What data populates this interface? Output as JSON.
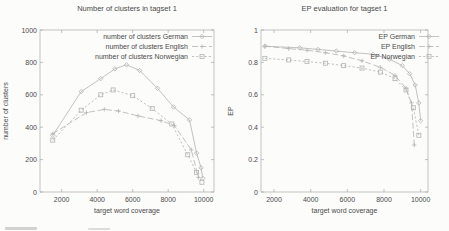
{
  "colors": {
    "line_gray": "#b2b2b2",
    "border_gray": "#a9a9a9",
    "text_gray": "#4a4a4a",
    "background": "#fcfcfb"
  },
  "chart_data": [
    {
      "type": "line",
      "title": "Number of clusters in tagset 1",
      "xlabel": "target word coverage",
      "ylabel": "number of clusters",
      "xlim": [
        780,
        10580
      ],
      "ylim": [
        0,
        1000
      ],
      "xticks": [
        2000,
        4000,
        6000,
        8000,
        10000
      ],
      "yticks": [
        0,
        200,
        400,
        600,
        800,
        1000
      ],
      "grid": false,
      "legend_position": "top-right-inside",
      "series": [
        {
          "name": "number of clusters German",
          "marker": "diamond",
          "dash": "solid",
          "points": [
            [
              1500,
              350
            ],
            [
              3100,
              620
            ],
            [
              4200,
              700
            ],
            [
              5000,
              760
            ],
            [
              5650,
              785
            ],
            [
              6400,
              750
            ],
            [
              7400,
              640
            ],
            [
              8300,
              525
            ],
            [
              9200,
              445
            ],
            [
              9600,
              240
            ],
            [
              9850,
              150
            ],
            [
              9950,
              85
            ]
          ]
        },
        {
          "name": "number of clusters English",
          "marker": "plus",
          "dash": "long-dash",
          "points": [
            [
              1500,
              360
            ],
            [
              3400,
              490
            ],
            [
              4400,
              510
            ],
            [
              5200,
              500
            ],
            [
              6300,
              470
            ],
            [
              7600,
              440
            ],
            [
              8350,
              410
            ],
            [
              9300,
              260
            ],
            [
              9700,
              90
            ]
          ]
        },
        {
          "name": "number of clusters Norwegian",
          "marker": "square",
          "dash": "short-dash",
          "points": [
            [
              1500,
              320
            ],
            [
              3100,
              505
            ],
            [
              4200,
              600
            ],
            [
              4900,
              630
            ],
            [
              6000,
              595
            ],
            [
              7100,
              515
            ],
            [
              8200,
              420
            ],
            [
              9100,
              230
            ],
            [
              9600,
              120
            ],
            [
              9900,
              60
            ]
          ]
        }
      ]
    },
    {
      "type": "line",
      "title": "EP evaluation for tagset 1",
      "xlabel": "target word coverage",
      "ylabel": "EP",
      "xlim": [
        1290,
        10400
      ],
      "ylim": [
        0,
        1
      ],
      "xticks": [
        2000,
        4000,
        6000,
        8000,
        10000
      ],
      "yticks": [
        0,
        0.2,
        0.4,
        0.6,
        0.8,
        1
      ],
      "grid": false,
      "legend_position": "top-right-inside",
      "series": [
        {
          "name": "EP German",
          "marker": "diamond",
          "dash": "solid",
          "points": [
            [
              1500,
              0.9
            ],
            [
              3400,
              0.89
            ],
            [
              4400,
              0.88
            ],
            [
              5400,
              0.87
            ],
            [
              6400,
              0.86
            ],
            [
              7400,
              0.85
            ],
            [
              8300,
              0.82
            ],
            [
              9000,
              0.78
            ],
            [
              9400,
              0.73
            ],
            [
              9700,
              0.66
            ],
            [
              9900,
              0.55
            ],
            [
              10000,
              0.44
            ]
          ]
        },
        {
          "name": "EP English",
          "marker": "plus",
          "dash": "long-dash",
          "points": [
            [
              1500,
              0.9
            ],
            [
              2800,
              0.885
            ],
            [
              3800,
              0.875
            ],
            [
              4800,
              0.86
            ],
            [
              5800,
              0.84
            ],
            [
              6800,
              0.81
            ],
            [
              7800,
              0.77
            ],
            [
              8600,
              0.72
            ],
            [
              9200,
              0.64
            ],
            [
              9500,
              0.55
            ],
            [
              9650,
              0.29
            ]
          ]
        },
        {
          "name": "EP Norwegian",
          "marker": "square",
          "dash": "short-dash",
          "points": [
            [
              1500,
              0.825
            ],
            [
              2800,
              0.815
            ],
            [
              3800,
              0.805
            ],
            [
              4800,
              0.795
            ],
            [
              5800,
              0.78
            ],
            [
              6800,
              0.765
            ],
            [
              7800,
              0.74
            ],
            [
              8600,
              0.7
            ],
            [
              9200,
              0.63
            ],
            [
              9600,
              0.52
            ],
            [
              9900,
              0.35
            ]
          ]
        }
      ]
    }
  ]
}
